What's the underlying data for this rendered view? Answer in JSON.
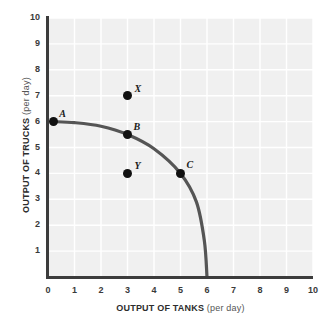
{
  "chart_data": {
    "type": "line",
    "title": "",
    "subtitle": "",
    "xlabel": "OUTPUT OF TANKS",
    "xlabel_unit": "(per day)",
    "ylabel": "OUTPUT OF TRUCKS",
    "ylabel_unit": "(per day)",
    "xlim": [
      0,
      10
    ],
    "ylim": [
      0,
      10
    ],
    "xticks": [
      "0",
      "1",
      "2",
      "3",
      "4",
      "5",
      "6",
      "7",
      "8",
      "9",
      "10"
    ],
    "yticks": [
      "1",
      "2",
      "3",
      "4",
      "5",
      "6",
      "7",
      "8",
      "9",
      "10"
    ],
    "grid": true,
    "legend": "none",
    "series": [
      {
        "name": "production possibilities frontier",
        "type": "line",
        "color": "#555555",
        "points": [
          {
            "x": 0.2,
            "y": 6.0
          },
          {
            "x": 1.0,
            "y": 5.96
          },
          {
            "x": 2.0,
            "y": 5.82
          },
          {
            "x": 3.0,
            "y": 5.5
          },
          {
            "x": 4.0,
            "y": 4.95
          },
          {
            "x": 5.0,
            "y": 4.0
          },
          {
            "x": 5.6,
            "y": 2.9
          },
          {
            "x": 5.9,
            "y": 1.4
          },
          {
            "x": 6.0,
            "y": 0.0
          }
        ]
      }
    ],
    "annotations": [
      {
        "label": "A",
        "x": 0.2,
        "y": 6.0,
        "on_curve": true,
        "label_dx": 6,
        "label_dy": -14
      },
      {
        "label": "B",
        "x": 3.0,
        "y": 5.5,
        "on_curve": true,
        "label_dx": 6,
        "label_dy": -14
      },
      {
        "label": "C",
        "x": 5.0,
        "y": 4.0,
        "on_curve": true,
        "label_dx": 6,
        "label_dy": -14
      },
      {
        "label": "X",
        "x": 3.0,
        "y": 7.0,
        "on_curve": false,
        "label_dx": 7,
        "label_dy": -13
      },
      {
        "label": "Y",
        "x": 3.0,
        "y": 4.0,
        "on_curve": false,
        "label_dx": 7,
        "label_dy": -13
      }
    ],
    "colors": {
      "plot_background": "#f0f0f0",
      "gridline": "#ffffff",
      "axis": "#3c3c3c",
      "curve": "#555555",
      "point": "#111111",
      "tick_text": "#3a3a3a",
      "title_text": "#2d2d2d"
    }
  }
}
